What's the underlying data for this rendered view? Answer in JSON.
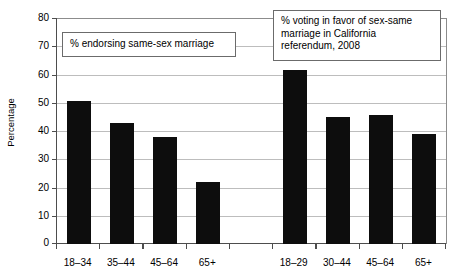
{
  "chart_data": {
    "type": "bar",
    "title": "",
    "xlabel": "",
    "ylabel": "Percentage",
    "ylim": [
      0,
      80
    ],
    "yticks": [
      0,
      10,
      20,
      30,
      40,
      50,
      60,
      70,
      80
    ],
    "ytick_labels": [
      "0",
      "10",
      "20",
      "30",
      "40",
      "50",
      "60",
      "70",
      "80"
    ],
    "grid": true,
    "legend": "none",
    "bar_color": "#0d0d0d",
    "gridline_color": "#bdbdbd",
    "axis_color": "#4d4d4d",
    "categories": [
      "18–34",
      "35–44",
      "45–64",
      "65+",
      "",
      "18–29",
      "30–44",
      "45–64",
      "65+"
    ],
    "values": [
      51,
      43,
      38,
      22,
      null,
      62,
      45,
      46,
      39
    ],
    "groups": [
      {
        "name": "% endorsing same-sex marriage",
        "categories": [
          "18–34",
          "35–44",
          "45–64",
          "65+"
        ],
        "values": [
          51,
          43,
          38,
          22
        ]
      },
      {
        "name": "% voting in favor of sex-same marriage in California referendum, 2008",
        "categories": [
          "18–29",
          "30–44",
          "45–64",
          "65+"
        ],
        "values": [
          62,
          45,
          46,
          39
        ]
      }
    ],
    "annotations": [
      {
        "id": "left",
        "text": "% endorsing same-sex marriage"
      },
      {
        "id": "right",
        "text": "% voting in favor of sex-same marriage in California referendum, 2008"
      }
    ]
  },
  "axis": {
    "y_title": "Percentage"
  },
  "annotations": {
    "left_text": "% endorsing same-sex marriage",
    "right_text": "% voting in favor of sex-same\nmarriage in California\nreferendum, 2008"
  },
  "ticks": {
    "y": [
      "80",
      "70",
      "60",
      "50",
      "40",
      "30",
      "20",
      "10",
      "0"
    ]
  },
  "xlabels": {
    "l0": "18–34",
    "l1": "35–44",
    "l2": "45–64",
    "l3": "65+",
    "l4": "",
    "l5": "18–29",
    "l6": "30–44",
    "l7": "45–64",
    "l8": "65+"
  }
}
